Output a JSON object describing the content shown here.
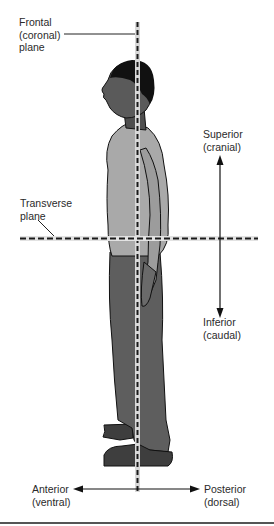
{
  "diagram": {
    "labels": {
      "frontal": {
        "line1": "Frontal",
        "line2": "(coronal)",
        "line3": "plane"
      },
      "transverse": {
        "line1": "Transverse",
        "line2": "plane"
      },
      "superior": {
        "line1": "Superior",
        "line2": "(cranial)"
      },
      "inferior": {
        "line1": "Inferior",
        "line2": "(caudal)"
      },
      "anterior": {
        "line1": "Anterior",
        "line2": "(ventral)"
      },
      "posterior": {
        "line1": "Posterior",
        "line2": "(dorsal)"
      }
    },
    "colors": {
      "plane_line": "#1a1a1a",
      "plane_highlight": "#d8d8d8",
      "shirt": "#a9a9a9",
      "pants": "#5e5e5e",
      "skin": "#5a5a5a",
      "hair": "#111111",
      "shoes": "#3e3e3e"
    }
  }
}
